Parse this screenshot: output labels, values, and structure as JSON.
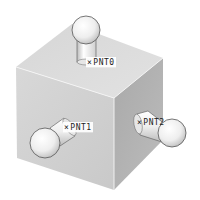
{
  "scene": {
    "description": "Shaded 3D cube with three ball-ended datum point pins",
    "colors": {
      "background": "#ffffff",
      "top_face": "#d9d9d9",
      "left_face": "#d2d2d2",
      "right_face": "#b3b3b3",
      "edge_highlight": "#f2f2f2",
      "ball_fill": "#f4f4f4",
      "ball_outline": "#555555",
      "label_text": "#222222"
    }
  },
  "points": [
    {
      "id": "pnt0",
      "mark": "×",
      "label": "PNT0",
      "face": "top"
    },
    {
      "id": "pnt1",
      "mark": "×",
      "label": "PNT1",
      "face": "left"
    },
    {
      "id": "pnt2",
      "mark": "×",
      "label": "PNT2",
      "face": "right"
    }
  ]
}
